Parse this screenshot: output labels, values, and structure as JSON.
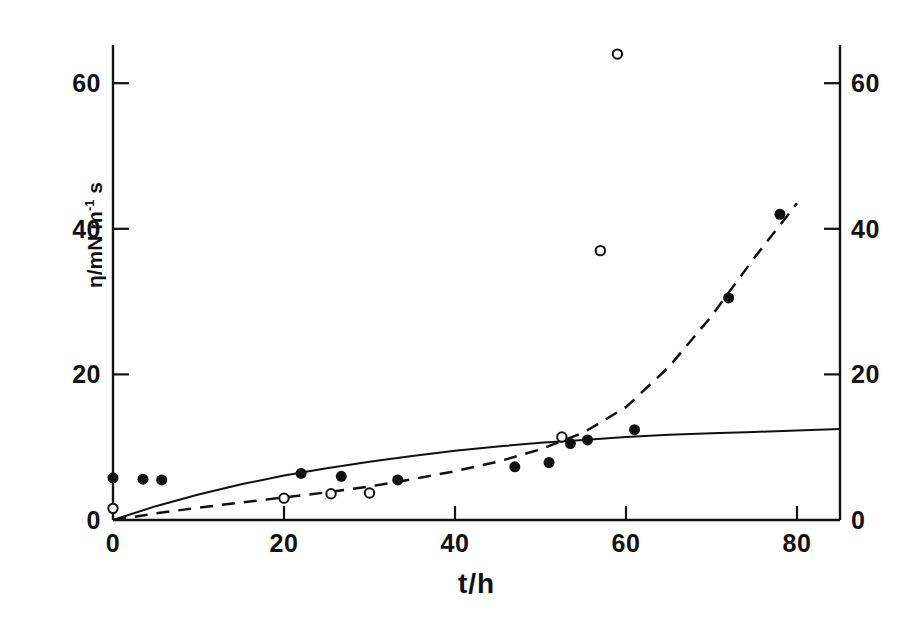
{
  "figure": {
    "background_color": "#ffffff",
    "ink_color": "#111111"
  },
  "chart_data": {
    "type": "scatter",
    "title": "",
    "subtitle": "",
    "xlabel": "t/h",
    "ylabel": "η/mN m⁻¹ s",
    "ylabel_parts": {
      "symbol": "η",
      "slash": "/",
      "unit": "mN m",
      "exponent": "-1",
      "unit_tail": " s"
    },
    "xlim": [
      0,
      85
    ],
    "ylim": [
      0,
      66
    ],
    "xticks": [
      0,
      20,
      40,
      60,
      80
    ],
    "xticklabels": [
      "0",
      "20",
      "40",
      "60",
      "80"
    ],
    "yticks": [
      0,
      20,
      40,
      60
    ],
    "yticklabels": [
      "0",
      "20",
      "40",
      "60"
    ],
    "right_axis": {
      "present": true,
      "ylim": [
        0,
        66
      ],
      "yticks": [
        0,
        20,
        40,
        60
      ],
      "yticklabels": [
        "0",
        "20",
        "40",
        "60"
      ]
    },
    "grid": false,
    "legend": {
      "present": false,
      "position": "none"
    },
    "tick_direction": "in",
    "series": [
      {
        "name": "filled-circles",
        "marker": "filled-circle",
        "marker_color": "#111111",
        "marker_size": 11,
        "points": [
          {
            "x": 0,
            "y": 5.8
          },
          {
            "x": 3.5,
            "y": 5.6
          },
          {
            "x": 5.7,
            "y": 5.5
          },
          {
            "x": 22,
            "y": 6.4
          },
          {
            "x": 26.7,
            "y": 6.0
          },
          {
            "x": 33.3,
            "y": 5.5
          },
          {
            "x": 47,
            "y": 7.3
          },
          {
            "x": 51,
            "y": 7.9
          },
          {
            "x": 53.5,
            "y": 10.5
          },
          {
            "x": 55.5,
            "y": 11.0
          },
          {
            "x": 61,
            "y": 12.4
          },
          {
            "x": 72,
            "y": 30.5
          },
          {
            "x": 78,
            "y": 42.0
          }
        ]
      },
      {
        "name": "open-circles",
        "marker": "open-circle",
        "marker_color": "#111111",
        "marker_size": 11,
        "points": [
          {
            "x": 0,
            "y": 1.6
          },
          {
            "x": 20,
            "y": 3.0
          },
          {
            "x": 25.5,
            "y": 3.6
          },
          {
            "x": 30,
            "y": 3.7
          },
          {
            "x": 52.5,
            "y": 11.4
          },
          {
            "x": 57,
            "y": 37.0
          },
          {
            "x": 59,
            "y": 64.0
          }
        ]
      }
    ],
    "curves": [
      {
        "name": "solid-curve",
        "style": "solid",
        "color": "#111111",
        "width": 2,
        "points": [
          {
            "x": 0,
            "y": 0
          },
          {
            "x": 5,
            "y": 1.9
          },
          {
            "x": 10,
            "y": 3.5
          },
          {
            "x": 15,
            "y": 4.9
          },
          {
            "x": 20,
            "y": 6.1
          },
          {
            "x": 25,
            "y": 7.1
          },
          {
            "x": 30,
            "y": 8.0
          },
          {
            "x": 35,
            "y": 8.8
          },
          {
            "x": 40,
            "y": 9.5
          },
          {
            "x": 45,
            "y": 10.1
          },
          {
            "x": 50,
            "y": 10.6
          },
          {
            "x": 55,
            "y": 11.0
          },
          {
            "x": 60,
            "y": 11.4
          },
          {
            "x": 65,
            "y": 11.7
          },
          {
            "x": 70,
            "y": 11.9
          },
          {
            "x": 75,
            "y": 12.1
          },
          {
            "x": 80,
            "y": 12.3
          },
          {
            "x": 85,
            "y": 12.5
          }
        ]
      },
      {
        "name": "dashed-curve",
        "style": "dashed",
        "color": "#111111",
        "width": 2.5,
        "dash_pattern": "13 9",
        "points": [
          {
            "x": 0,
            "y": 0
          },
          {
            "x": 5,
            "y": 0.9
          },
          {
            "x": 10,
            "y": 1.7
          },
          {
            "x": 15,
            "y": 2.4
          },
          {
            "x": 20,
            "y": 3.1
          },
          {
            "x": 25,
            "y": 3.8
          },
          {
            "x": 30,
            "y": 4.6
          },
          {
            "x": 35,
            "y": 5.6
          },
          {
            "x": 40,
            "y": 6.7
          },
          {
            "x": 45,
            "y": 8.0
          },
          {
            "x": 50,
            "y": 9.7
          },
          {
            "x": 55,
            "y": 12.0
          },
          {
            "x": 60,
            "y": 15.5
          },
          {
            "x": 65,
            "y": 21.0
          },
          {
            "x": 70,
            "y": 28.0
          },
          {
            "x": 75,
            "y": 36.0
          },
          {
            "x": 80,
            "y": 43.5
          }
        ]
      }
    ]
  },
  "axis_geometry": {
    "left_px": 113,
    "right_px": 840,
    "bottom_px": 520,
    "top_px": 45,
    "x_unit_px": 8.55,
    "y_unit_px": 7.28
  }
}
